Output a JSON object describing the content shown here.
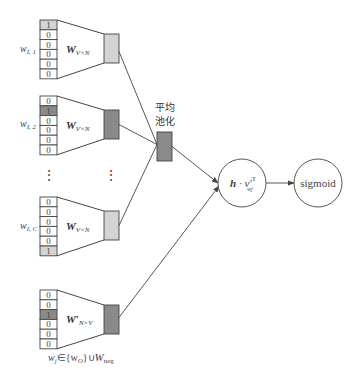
{
  "diagram": {
    "type": "skip-gram negative sampling / CBOW-style network",
    "colors": {
      "stroke": "#444444",
      "light_fill": "#d4d4d4",
      "dark_fill": "#8a8a8a",
      "background": "#ffffff"
    },
    "input_blocks": [
      {
        "label_main": "w",
        "label_sub": "I, 1",
        "vector": [
          "1",
          "0",
          "0",
          "0",
          "0",
          "0"
        ],
        "hot_index": 0,
        "weight_label": "W",
        "weight_sub": "V×N",
        "output_shade": "light"
      },
      {
        "label_main": "w",
        "label_sub": "I, 2",
        "vector": [
          "0",
          "1",
          "0",
          "0",
          "0",
          "0"
        ],
        "hot_index": 1,
        "weight_label": "W",
        "weight_sub": "V×N",
        "output_shade": "dark"
      },
      {
        "label_main": "w",
        "label_sub": "I, C",
        "vector": [
          "0",
          "0",
          "0",
          "0",
          "0",
          "1"
        ],
        "hot_index": 5,
        "weight_label": "W",
        "weight_sub": "V×N",
        "output_shade": "light"
      }
    ],
    "output_block": {
      "vector": [
        "0",
        "0",
        "1",
        "0",
        "0",
        "0"
      ],
      "hot_index": 2,
      "weight_label": "W′",
      "weight_sub": "N×V",
      "caption_main": "w",
      "caption_sub": "j",
      "caption_rest": "∈{w",
      "caption_o": "O",
      "caption_union": "}∪",
      "caption_W": "W",
      "caption_neg": "neg"
    },
    "ellipsis": "⋮",
    "pooling": {
      "label_line1": "平均",
      "label_line2": "池化"
    },
    "dot_node": {
      "label_h": "h",
      "label_dot": " · v′",
      "label_sup": "T",
      "label_sub": "wj"
    },
    "sigmoid_node": {
      "label": "sigmoid"
    }
  }
}
